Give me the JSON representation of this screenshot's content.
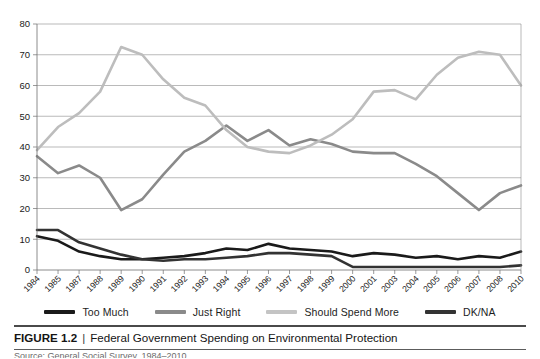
{
  "chart_data": {
    "type": "line",
    "title": "Federal Government Spending on Environmental Protection",
    "xlabel": "",
    "ylabel": "",
    "ylim": [
      0,
      80
    ],
    "ytick_step": 10,
    "yticks": [
      0,
      10,
      20,
      30,
      40,
      50,
      60,
      70,
      80
    ],
    "grid": "horizontal",
    "legend_position": "bottom",
    "categories": [
      "1984",
      "1985",
      "1987",
      "1988",
      "1989",
      "1990",
      "1991",
      "1992",
      "1993",
      "1994",
      "1995",
      "1996",
      "1997",
      "1998",
      "1999",
      "2000",
      "2001",
      "2003",
      "2004",
      "2005",
      "2006",
      "2007",
      "2008",
      "2010"
    ],
    "series": [
      {
        "name": "Too Much",
        "color": "#1a1a1a",
        "values": [
          11,
          9.5,
          6,
          4.5,
          3.5,
          3.5,
          4,
          4.5,
          5.5,
          7,
          6.5,
          8.5,
          7,
          6.5,
          6,
          4.5,
          5.5,
          5,
          4,
          4.5,
          3.5,
          4.5,
          4,
          6
        ]
      },
      {
        "name": "Just Right",
        "color": "#8a8a8a",
        "values": [
          37,
          31.5,
          34,
          30,
          19.5,
          23,
          31,
          38.5,
          42,
          47,
          42,
          45.5,
          40.5,
          42.5,
          41,
          38.5,
          38,
          38,
          34.5,
          30.5,
          25,
          19.5,
          25,
          27.5
        ]
      },
      {
        "name": "Should Spend More",
        "color": "#bdbdbd",
        "values": [
          39,
          46.5,
          51,
          58,
          72.5,
          70,
          62,
          56,
          53.5,
          45.5,
          40,
          38.5,
          38,
          40.5,
          44,
          49,
          58,
          58.5,
          55.5,
          63.5,
          69,
          71,
          70,
          60
        ]
      },
      {
        "name": "DK/NA",
        "color": "#333333",
        "values": [
          13,
          13,
          9,
          7,
          5,
          3.5,
          3,
          3.5,
          3.5,
          4,
          4.5,
          5.5,
          5.5,
          5,
          4.5,
          1,
          1,
          1,
          1,
          1,
          1,
          1,
          1,
          1.5
        ]
      }
    ]
  },
  "legend": {
    "items": [
      {
        "label": "Too Much",
        "color": "#1a1a1a"
      },
      {
        "label": "Just Right",
        "color": "#8a8a8a"
      },
      {
        "label": "Should Spend More",
        "color": "#c4c4c4"
      },
      {
        "label": "DK/NA",
        "color": "#333333"
      }
    ]
  },
  "caption": {
    "figure_number": "FIGURE 1.2",
    "separator": "|",
    "title": "Federal Government Spending on Environmental Protection",
    "source_partial": "Source: General Social Survey, 1984–2010."
  }
}
